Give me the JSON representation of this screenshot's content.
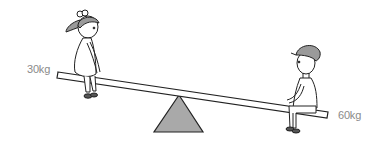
{
  "figure": {
    "left_person": {
      "role": "girl",
      "weight_label": "30kg"
    },
    "right_person": {
      "role": "boy",
      "weight_label": "60kg"
    },
    "colors": {
      "fulcrum_fill": "#a9a9a9",
      "line": "#222222",
      "label_text": "#8a8a8a",
      "hair_cap_fill": "#9a9a9a",
      "background": "#ffffff"
    }
  }
}
